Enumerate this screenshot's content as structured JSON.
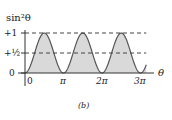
{
  "chart_data": {
    "type": "area",
    "function": "sin^2(theta)",
    "title": "",
    "ylabel": "sin²θ",
    "xlabel": "θ",
    "caption": "(b)",
    "xlim_pi": [
      0,
      3.15
    ],
    "ylim": [
      0,
      1
    ],
    "x_ticks": [
      {
        "value_pi": 0,
        "label": "0"
      },
      {
        "value_pi": 1,
        "label": "π"
      },
      {
        "value_pi": 2,
        "label": "2π"
      },
      {
        "value_pi": 3,
        "label": "3π"
      }
    ],
    "y_ticks": [
      {
        "value": 0,
        "label": "0"
      },
      {
        "value": 0.5,
        "label": "+½"
      },
      {
        "value": 1,
        "label": "+1"
      }
    ],
    "reference_lines": [
      {
        "value": 1,
        "style": "dashed"
      },
      {
        "value": 0.5,
        "style": "dashed"
      }
    ],
    "series": [
      {
        "name": "sin²θ",
        "fill": "#d9d9d9",
        "stroke": "#555555"
      }
    ],
    "grid": false,
    "legend": "none"
  }
}
